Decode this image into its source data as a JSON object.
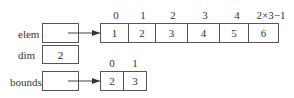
{
  "variables": [
    {
      "name": "elem",
      "value": "",
      "points_to": "elem_array"
    },
    {
      "name": "dim",
      "value": "2"
    },
    {
      "name": "bounds",
      "value": "",
      "points_to": "bounds_array"
    }
  ],
  "elem_array": {
    "indices": [
      "0",
      "1",
      "2",
      "3",
      "4",
      "2×3−1"
    ],
    "values": [
      "1",
      "2",
      "3",
      "4",
      "5",
      "6"
    ]
  },
  "bounds_array": {
    "indices": [
      "0",
      "1"
    ],
    "values": [
      "2",
      "3"
    ]
  },
  "colors": {
    "line": "#555555",
    "text": "#333333"
  }
}
